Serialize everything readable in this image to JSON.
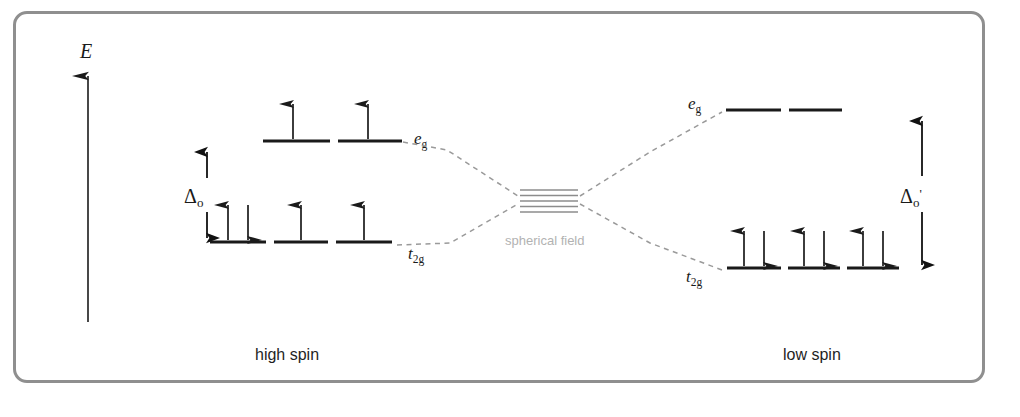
{
  "figure": {
    "border_color": "#8f8f8f",
    "background": "#ffffff"
  },
  "axis": {
    "label": "E",
    "name": "energy-axis",
    "direction": "up"
  },
  "center": {
    "label": "spherical field",
    "label_color": "#b2b2b2",
    "degenerate_line_count": 5,
    "line_color": "#8c8c8c"
  },
  "panels": [
    {
      "id": "high-spin",
      "caption": "high spin",
      "splitting": {
        "label": "Δ",
        "subscript": "o",
        "prime": "",
        "full": "Δo"
      },
      "levels": [
        {
          "set": "eg",
          "label": "e",
          "subscript": "g",
          "orbital_count": 2,
          "electrons": [
            "up",
            "up"
          ],
          "occupancy": [
            1,
            1
          ]
        },
        {
          "set": "t2g",
          "label": "t",
          "subscript": "2g",
          "orbital_count": 3,
          "electrons": [
            "up-down",
            "up",
            "up"
          ],
          "occupancy": [
            2,
            1,
            1
          ]
        }
      ],
      "total_electrons": 6,
      "unpaired_electrons": 4
    },
    {
      "id": "low-spin",
      "caption": "low spin",
      "splitting": {
        "label": "Δ",
        "subscript": "o",
        "prime": "'",
        "full": "Δo'"
      },
      "levels": [
        {
          "set": "eg",
          "label": "e",
          "subscript": "g",
          "orbital_count": 2,
          "electrons": [
            "",
            ""
          ],
          "occupancy": [
            0,
            0
          ]
        },
        {
          "set": "t2g",
          "label": "t",
          "subscript": "2g",
          "orbital_count": 3,
          "electrons": [
            "up-down",
            "up-down",
            "up-down"
          ],
          "occupancy": [
            2,
            2,
            2
          ]
        }
      ],
      "total_electrons": 6,
      "unpaired_electrons": 0
    }
  ]
}
